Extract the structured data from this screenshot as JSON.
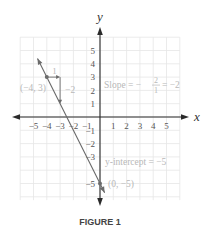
{
  "figure": {
    "caption": "FIGURE 1",
    "axis_x_label": "x",
    "axis_y_label": "y",
    "colors": {
      "axis": "#2a2a2a",
      "grid": "#e6e6e6",
      "line": "#6b6b6b",
      "annotation": "#b8b8b8",
      "tick_label": "#555555",
      "caption": "#444444"
    }
  },
  "chart_data": {
    "type": "line",
    "title": "",
    "xlabel": "x",
    "ylabel": "y",
    "xlim": [
      -6,
      6
    ],
    "ylim": [
      -6.25,
      6
    ],
    "grid": true,
    "x_ticks": [
      -5,
      -4,
      -3,
      -2,
      -1,
      1,
      2,
      3,
      4,
      5
    ],
    "x_tick_labels": [
      "−5",
      "−4",
      "−3",
      "−2",
      "−1",
      "1",
      "2",
      "3",
      "4",
      "5"
    ],
    "y_ticks": [
      5,
      4,
      3,
      2,
      1,
      -1,
      -2,
      -3,
      -5
    ],
    "y_tick_labels": [
      "5",
      "4",
      "3",
      "2",
      "1",
      "−1",
      "−2",
      "−3",
      "−5"
    ],
    "series": [
      {
        "name": "y = -2x - 5",
        "slope": -2,
        "intercept": -5,
        "x_range": [
          -4.7,
          0.35
        ]
      }
    ],
    "points": [
      {
        "x": -4,
        "y": 3,
        "label": "(−4, 3)"
      },
      {
        "x": 0,
        "y": -5,
        "label": "(0, −5)"
      }
    ],
    "run_rise": {
      "from": [
        -4,
        3
      ],
      "run": 1,
      "rise": -2,
      "run_label": "1",
      "rise_label": "−2"
    },
    "annotations": {
      "slope_text_prefix": "Slope = −",
      "slope_numerator": "2",
      "slope_denominator": "1",
      "slope_text_suffix": "= −2",
      "intercept_text": "y-intercept = −5"
    }
  }
}
